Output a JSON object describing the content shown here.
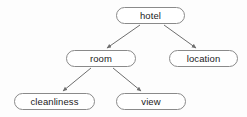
{
  "diagram": {
    "background_color": "#fdfdfd",
    "node_fill": "#ffffff",
    "node_border_color": "#8a8a8a",
    "edge_color": "#6e6e6e",
    "text_color": "#1b1b1b",
    "nodes": [
      {
        "id": "hotel",
        "label": "hotel",
        "x": 116,
        "y": 7,
        "width": 69,
        "height": 17
      },
      {
        "id": "room",
        "label": "room",
        "x": 66,
        "y": 50,
        "width": 70,
        "height": 17
      },
      {
        "id": "location",
        "label": "location",
        "x": 169,
        "y": 50,
        "width": 69,
        "height": 17
      },
      {
        "id": "cleanliness",
        "label": "cleanliness",
        "x": 14,
        "y": 93,
        "width": 81,
        "height": 17
      },
      {
        "id": "view",
        "label": "view",
        "x": 116,
        "y": 93,
        "width": 70,
        "height": 17
      }
    ],
    "edges": [
      {
        "from": "hotel",
        "to": "room",
        "x1": 140,
        "y1": 25,
        "x2": 107,
        "y2": 48
      },
      {
        "from": "hotel",
        "to": "location",
        "x1": 164,
        "y1": 25,
        "x2": 196,
        "y2": 48
      },
      {
        "from": "room",
        "to": "cleanliness",
        "x1": 91,
        "y1": 68,
        "x2": 63,
        "y2": 91
      },
      {
        "from": "room",
        "to": "view",
        "x1": 113,
        "y1": 68,
        "x2": 141,
        "y2": 91
      }
    ]
  }
}
